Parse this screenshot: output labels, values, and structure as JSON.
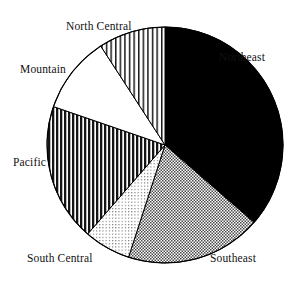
{
  "chart_data": {
    "type": "pie",
    "title": "",
    "subtitle": "",
    "xlabel": "",
    "ylabel": "",
    "legend_position": "none",
    "grid": false,
    "labels_position": "outside",
    "start_angle_deg": 0,
    "direction": "clockwise",
    "categories": [
      "Northeast",
      "Southeast",
      "South Central",
      "Pacific",
      "Mountain",
      "North Central"
    ],
    "values": [
      36.4,
      18.6,
      6.4,
      19.0,
      10.5,
      9.1
    ],
    "slices": [
      {
        "label": "Northeast",
        "value": 36.4,
        "start_deg": 0,
        "end_deg": 131,
        "fill": "solid-black",
        "color": "#000000"
      },
      {
        "label": "Southeast",
        "value": 18.6,
        "start_deg": 131,
        "end_deg": 198,
        "fill": "checker-medium",
        "color": "#9a9a9a"
      },
      {
        "label": "South Central",
        "value": 6.4,
        "start_deg": 198,
        "end_deg": 221,
        "fill": "dots-light",
        "color": "#d3d3d3"
      },
      {
        "label": "Pacific",
        "value": 19.0,
        "start_deg": 221,
        "end_deg": 289,
        "fill": "stripes-vertical-dark",
        "color": "#3a3a3a"
      },
      {
        "label": "Mountain",
        "value": 10.5,
        "start_deg": 289,
        "end_deg": 327,
        "fill": "white",
        "color": "#ffffff"
      },
      {
        "label": "North Central",
        "value": 9.1,
        "start_deg": 327,
        "end_deg": 360,
        "fill": "stripes-vertical-light",
        "color": "#8f8f8f"
      }
    ],
    "geometry": {
      "center_x": 165,
      "center_y": 145,
      "radius": 118
    },
    "outline_color": "#000000",
    "background_color": "#ffffff"
  },
  "labels": {
    "northeast": "Northeast",
    "southeast": "Southeast",
    "south_central": "South Central",
    "pacific": "Pacific",
    "mountain": "Mountain",
    "north_central": "North Central"
  }
}
